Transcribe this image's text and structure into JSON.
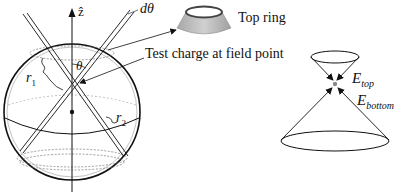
{
  "labels": {
    "z_axis": "ẑ",
    "d_theta": "dθ",
    "theta": "θ",
    "r1": "r",
    "r1_sub": "1",
    "r2": "r",
    "r2_sub": "2",
    "top_ring": "Top ring",
    "test_charge": "Test charge at field point",
    "e_top": "E",
    "e_top_sub": "top",
    "e_bottom": "E",
    "e_bottom_sub": "bottom"
  },
  "colors": {
    "line": "#111111",
    "ring_dark": "#555555",
    "ring_light": "#b8b8b8",
    "dot": "#888888"
  }
}
